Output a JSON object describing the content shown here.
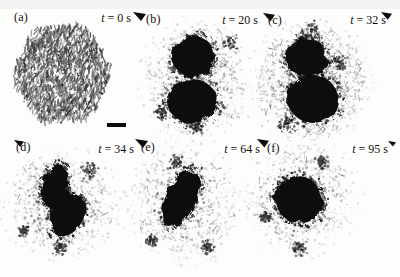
{
  "figure": {
    "kind": "micrograph-time-sequence",
    "colors": {
      "background": "#fdfdfc",
      "ink": "#0d0d0d",
      "speckle_dark": "#222222",
      "speckle_mid": "#6b6b6b",
      "label_text": "#111111",
      "top_band": "#e9e9e6"
    },
    "panels": [
      {
        "id": "a",
        "label": "(a)",
        "time_var": "t",
        "time_rest": " = 0 s",
        "type": "texture-disc",
        "disc": {
          "cx": 62,
          "cy": 74,
          "r": 48
        },
        "blobs": [],
        "clusters": []
      },
      {
        "id": "b",
        "label": "(b)",
        "time_var": "t",
        "time_rest": " = 20 s",
        "type": "speckle",
        "cloud": {
          "cx": 196,
          "cy": 80,
          "rx": 50,
          "ry": 56,
          "dots": 950,
          "streaks": 90
        },
        "blobs": [
          {
            "cx": 193,
            "cy": 56,
            "rx": 21,
            "ry": 21,
            "rot": 0
          },
          {
            "cx": 192,
            "cy": 101,
            "rx": 25,
            "ry": 22,
            "rot": 0
          }
        ],
        "clusters": [
          [
            230,
            42,
            9
          ],
          [
            162,
            113,
            8
          ],
          [
            196,
            127,
            8
          ]
        ]
      },
      {
        "id": "c",
        "label": "(c)",
        "time_var": "t",
        "time_rest": " = 32 s",
        "type": "speckle",
        "cloud": {
          "cx": 311,
          "cy": 82,
          "rx": 54,
          "ry": 58,
          "dots": 1150,
          "streaks": 330
        },
        "blobs": [
          {
            "cx": 306,
            "cy": 57,
            "rx": 21,
            "ry": 19,
            "rot": 0
          },
          {
            "cx": 313,
            "cy": 99,
            "rx": 25,
            "ry": 24,
            "rot": 0
          }
        ],
        "clusters": [
          [
            312,
            30,
            11
          ],
          [
            286,
            124,
            10
          ],
          [
            340,
            62,
            9
          ]
        ]
      },
      {
        "id": "d",
        "label": "(d)",
        "time_var": "t",
        "time_rest": " = 34 s",
        "type": "speckle",
        "cloud": {
          "cx": 62,
          "cy": 204,
          "rx": 54,
          "ry": 50,
          "dots": 900,
          "streaks": 60
        },
        "blobs": [
          {
            "cx": 55,
            "cy": 186,
            "rx": 13,
            "ry": 22,
            "rot": 12
          },
          {
            "cx": 68,
            "cy": 216,
            "rx": 15,
            "ry": 22,
            "rot": 32
          },
          {
            "cx": 60,
            "cy": 200,
            "rx": 12,
            "ry": 12,
            "rot": 0
          }
        ],
        "clusters": [
          [
            90,
            171,
            9
          ],
          [
            60,
            248,
            8
          ],
          [
            24,
            231,
            6
          ]
        ]
      },
      {
        "id": "e",
        "label": "(e)",
        "time_var": "t",
        "time_rest": " = 64 s",
        "type": "speckle",
        "cloud": {
          "cx": 184,
          "cy": 204,
          "rx": 53,
          "ry": 56,
          "dots": 900,
          "streaks": 70
        },
        "blobs": [
          {
            "cx": 181,
            "cy": 199,
            "rx": 15,
            "ry": 30,
            "rot": 27
          }
        ],
        "clusters": [
          [
            176,
            162,
            9
          ],
          [
            208,
            248,
            8
          ],
          [
            152,
            240,
            7
          ]
        ]
      },
      {
        "id": "f",
        "label": "(f)",
        "time_var": "t",
        "time_rest": " = 95 s",
        "type": "speckle",
        "cloud": {
          "cx": 301,
          "cy": 198,
          "rx": 54,
          "ry": 52,
          "dots": 820,
          "streaks": 60
        },
        "blobs": [
          {
            "cx": 298,
            "cy": 199,
            "rx": 23,
            "ry": 23,
            "rot": 0
          },
          {
            "cx": 303,
            "cy": 203,
            "rx": 20,
            "ry": 19,
            "rot": 0
          }
        ],
        "clusters": [
          [
            322,
            162,
            8
          ],
          [
            300,
            249,
            8
          ],
          [
            266,
            216,
            7
          ]
        ]
      }
    ],
    "scale_bar": {
      "x": 107,
      "y": 123,
      "width": 19,
      "height": 4
    },
    "corner_markers": [
      [
        133,
        12,
        13
      ],
      [
        263,
        13,
        12
      ],
      [
        381,
        12,
        11
      ],
      [
        14,
        140,
        10
      ],
      [
        135,
        139,
        13
      ],
      [
        257,
        139,
        12
      ],
      [
        388,
        141,
        8
      ]
    ]
  }
}
